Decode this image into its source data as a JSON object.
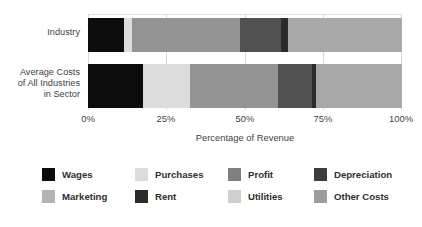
{
  "chart_data": {
    "type": "bar",
    "orientation": "horizontal",
    "stacked": true,
    "title": "",
    "xlabel": "Percentage of Revenue",
    "ylabel": "",
    "xlim": [
      0,
      100
    ],
    "xticks": [
      "0%",
      "25%",
      "50%",
      "75%",
      "100%"
    ],
    "xtick_values": [
      0,
      25,
      50,
      75,
      100
    ],
    "grid": true,
    "legend_position": "bottom",
    "categories": [
      "Industry",
      "Average Costs\nof All Industries\nin Sector"
    ],
    "series": [
      {
        "name": "Wages",
        "color": "#0c0c0c",
        "values": [
          11.5,
          17.5
        ]
      },
      {
        "name": "Purchases",
        "color": "#dcdcdc",
        "values": [
          2.5,
          15.0
        ]
      },
      {
        "name": "Marketing",
        "color": "#949494",
        "values": [
          34.4,
          28.0
        ]
      },
      {
        "name": "Profit",
        "color": "#515151",
        "values": [
          13.1,
          10.8
        ]
      },
      {
        "name": "Rent",
        "color": "#2b2b2b",
        "values": [
          2.2,
          1.3
        ]
      },
      {
        "name": "Utilities",
        "color": "#cfcfcf",
        "values": [
          0,
          0
        ]
      },
      {
        "name": "Depreciation",
        "color": "#3d3d3d",
        "values": [
          0,
          0
        ]
      },
      {
        "name": "Other Costs",
        "color": "#a8a8a8",
        "values": [
          36.3,
          27.4
        ]
      }
    ]
  },
  "axis": {
    "title": "Percentage of Revenue",
    "ticks": [
      "0%",
      "25%",
      "50%",
      "75%",
      "100%"
    ]
  },
  "categories": [
    {
      "label": "Industry"
    },
    {
      "label": "Average Costs\nof All Industries\nin Sector"
    }
  ],
  "legend": {
    "rows": [
      [
        {
          "label": "Wages",
          "color": "#0c0c0c"
        },
        {
          "label": "Purchases",
          "color": "#dcdcdc"
        },
        {
          "label": "Profit",
          "color": "#808080"
        },
        {
          "label": "Depreciation",
          "color": "#3d3d3d"
        }
      ],
      [
        {
          "label": "Marketing",
          "color": "#b4b4b4"
        },
        {
          "label": "Rent",
          "color": "#2b2b2b"
        },
        {
          "label": "Utilities",
          "color": "#cfcfcf"
        },
        {
          "label": "Other Costs",
          "color": "#9c9c9c"
        }
      ]
    ]
  }
}
